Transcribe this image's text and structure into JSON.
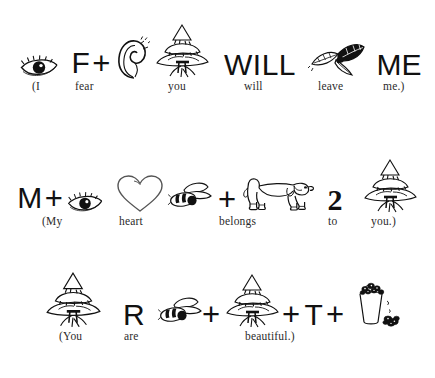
{
  "page": {
    "background_color": "#ffffff",
    "ink_color": "#111111"
  },
  "rows": [
    {
      "id": "row-i-fear-you-will-leave-me",
      "sentence": "(I fear you will leave me.)",
      "tokens": [
        {
          "name": "eye-icon",
          "kind": "icon",
          "icon": "eye",
          "text": "",
          "x": 18,
          "w": 42,
          "caption": "(I",
          "caption_x": 32
        },
        {
          "name": "letter-f",
          "kind": "combo",
          "icon": "plus",
          "text": "F",
          "x": 68,
          "w": 46,
          "caption": "fear",
          "caption_x": 75
        },
        {
          "name": "ear-icon",
          "kind": "icon",
          "icon": "ear",
          "text": "",
          "x": 114,
          "w": 36,
          "caption": "",
          "caption_x": 0
        },
        {
          "name": "tree-icon",
          "kind": "icon",
          "icon": "yew-tree",
          "text": "",
          "x": 154,
          "w": 56,
          "caption": "you",
          "caption_x": 168
        },
        {
          "name": "word-will",
          "kind": "text",
          "icon": "",
          "text": "WILL",
          "x": 226,
          "w": 68,
          "caption": "will",
          "caption_x": 244
        },
        {
          "name": "leaves-icon",
          "kind": "icon",
          "icon": "leaves",
          "text": "",
          "x": 310,
          "w": 56,
          "caption": "leave",
          "caption_x": 318
        },
        {
          "name": "word-me",
          "kind": "text",
          "icon": "",
          "text": "ME",
          "x": 376,
          "w": 46,
          "caption": "me.)",
          "caption_x": 383
        }
      ]
    },
    {
      "id": "row-my-heart-belongs-to-you",
      "sentence": "(My heart belongs to you.)",
      "tokens": [
        {
          "name": "letter-m",
          "kind": "combo",
          "icon": "plus",
          "text": "M",
          "x": 16,
          "w": 48,
          "caption": "(My",
          "caption_x": 42
        },
        {
          "name": "eye-icon",
          "kind": "icon",
          "icon": "eye",
          "text": "",
          "x": 64,
          "w": 42,
          "caption": "",
          "caption_x": 0
        },
        {
          "name": "heart-icon",
          "kind": "icon",
          "icon": "heart",
          "text": "",
          "x": 115,
          "w": 50,
          "caption": "heart",
          "caption_x": 119
        },
        {
          "name": "bee-icon",
          "kind": "icon",
          "icon": "bee",
          "text": "",
          "x": 170,
          "w": 46,
          "caption": "belongs",
          "caption_x": 219
        },
        {
          "name": "plus-sign",
          "kind": "plus",
          "icon": "plus",
          "text": "",
          "x": 216,
          "w": 22,
          "caption": "",
          "caption_x": 0
        },
        {
          "name": "dog-icon",
          "kind": "icon",
          "icon": "dachshund",
          "text": "",
          "x": 238,
          "w": 72,
          "caption": "",
          "caption_x": 0
        },
        {
          "name": "number-two",
          "kind": "text",
          "icon": "",
          "text": "2",
          "x": 322,
          "w": 26,
          "caption": "to",
          "caption_x": 328
        },
        {
          "name": "tree-icon",
          "kind": "icon",
          "icon": "yew-tree",
          "text": "",
          "x": 362,
          "w": 56,
          "caption": "you.)",
          "caption_x": 371
        }
      ]
    },
    {
      "id": "row-you-are-beautiful",
      "sentence": "(You are beautiful.)",
      "tokens": [
        {
          "name": "tree-icon",
          "kind": "icon",
          "icon": "yew-tree",
          "text": "",
          "x": 44,
          "w": 58,
          "caption": "(You",
          "caption_x": 59
        },
        {
          "name": "letter-r",
          "kind": "text",
          "icon": "",
          "text": "R",
          "x": 122,
          "w": 24,
          "caption": "are",
          "caption_x": 124
        },
        {
          "name": "bee-icon",
          "kind": "icon",
          "icon": "bee",
          "text": "",
          "x": 160,
          "w": 44,
          "caption": "beautiful.)",
          "caption_x": 245
        },
        {
          "name": "plus-sign-1",
          "kind": "plus",
          "icon": "plus",
          "text": "",
          "x": 200,
          "w": 22,
          "caption": "",
          "caption_x": 0
        },
        {
          "name": "tree-icon-2",
          "kind": "icon",
          "icon": "yew-tree",
          "text": "",
          "x": 224,
          "w": 56,
          "caption": "",
          "caption_x": 0
        },
        {
          "name": "plus-sign-2",
          "kind": "plus",
          "icon": "plus",
          "text": "",
          "x": 280,
          "w": 22,
          "caption": "",
          "caption_x": 0
        },
        {
          "name": "letter-t",
          "kind": "text",
          "icon": "",
          "text": "T",
          "x": 304,
          "w": 20,
          "caption": "",
          "caption_x": 0
        },
        {
          "name": "plus-sign-3",
          "kind": "plus",
          "icon": "plus",
          "text": "",
          "x": 324,
          "w": 22,
          "caption": "",
          "caption_x": 0
        },
        {
          "name": "cup-icon",
          "kind": "icon",
          "icon": "full-cup",
          "text": "",
          "x": 350,
          "w": 54,
          "caption": "",
          "caption_x": 0
        }
      ]
    }
  ]
}
